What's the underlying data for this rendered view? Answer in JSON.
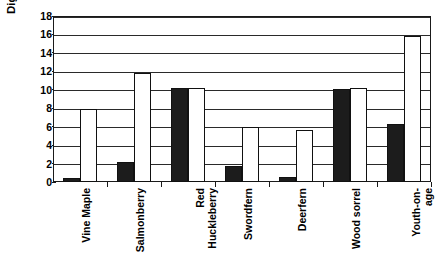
{
  "chart_data": {
    "type": "bar",
    "title": "",
    "xlabel": "",
    "ylabel": "Digestible protein (%)",
    "ylim": [
      0,
      18
    ],
    "ytick_step": 2,
    "yticks": [
      0,
      2,
      4,
      6,
      8,
      10,
      12,
      14,
      16,
      18
    ],
    "grid": true,
    "legend": "none",
    "categories": [
      "Vine Maple",
      "Salmonberry",
      "Red\nHuckleberry",
      "Swordfern",
      "Deerfern",
      "Wood sorrel",
      "Youth-on-\nage"
    ],
    "series": [
      {
        "name": "dark",
        "color": "#1c1c1c",
        "values": [
          0.4,
          2.2,
          10.2,
          1.7,
          0.5,
          10.1,
          6.3
        ]
      },
      {
        "name": "light",
        "color": "#ffffff",
        "values": [
          7.9,
          11.8,
          10.2,
          6.0,
          5.6,
          10.2,
          15.8
        ]
      }
    ]
  },
  "axis": {
    "y_title": "Digestible protein (%)",
    "y_tick_labels": [
      "0",
      "2",
      "4",
      "6",
      "8",
      "10",
      "12",
      "14",
      "16",
      "18"
    ]
  },
  "colors": {
    "dark_bar": "#1c1c1c",
    "light_bar": "#ffffff",
    "axis": "#1a1a1a",
    "gridline": "#2a2a2a",
    "background": "#ffffff"
  }
}
